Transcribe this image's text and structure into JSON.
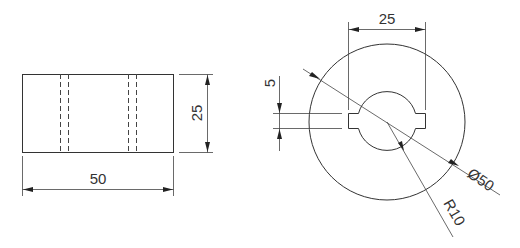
{
  "drawing": {
    "front_view": {
      "width_dimension": "50",
      "height_dimension": "25"
    },
    "side_view": {
      "key_span_dimension": "25",
      "key_width_dimension": "5",
      "outer_diameter_dimension": "Ø50",
      "inner_radius_dimension": "R10"
    }
  },
  "colors": {
    "line": "#333333",
    "background": "#ffffff"
  }
}
